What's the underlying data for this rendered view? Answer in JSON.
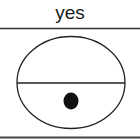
{
  "header": {
    "label": "yes"
  },
  "figure": {
    "shape": "ellipse",
    "divider": "horizontal",
    "dot_position": "lower-half",
    "colors": {
      "stroke": "#222222",
      "dot": "#111111",
      "background": "#ffffff"
    }
  }
}
